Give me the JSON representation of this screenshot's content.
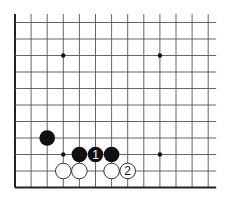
{
  "diagram": {
    "type": "go-board-corner",
    "grid": {
      "columns": 13,
      "rows": 11,
      "open_top": true,
      "open_right": true,
      "edge_left": true,
      "edge_bottom": true
    },
    "star_points": [
      {
        "col": 3,
        "row": 2
      },
      {
        "col": 9,
        "row": 2
      },
      {
        "col": 3,
        "row": 8
      },
      {
        "col": 9,
        "row": 8
      }
    ],
    "stones": [
      {
        "color": "black",
        "col": 2,
        "row": 7,
        "label": ""
      },
      {
        "color": "black",
        "col": 4,
        "row": 8,
        "label": ""
      },
      {
        "color": "black",
        "col": 5,
        "row": 8,
        "label": "1"
      },
      {
        "color": "black",
        "col": 6,
        "row": 8,
        "label": ""
      },
      {
        "color": "white",
        "col": 3,
        "row": 9,
        "label": ""
      },
      {
        "color": "white",
        "col": 4,
        "row": 9,
        "label": ""
      },
      {
        "color": "white",
        "col": 6,
        "row": 9,
        "label": ""
      },
      {
        "color": "white",
        "col": 7,
        "row": 9,
        "label": "2"
      }
    ],
    "colors": {
      "line": "#555555",
      "edge": "#222222",
      "black_stone": "#111111",
      "white_stone": "#ffffff",
      "background": "#ffffff"
    }
  }
}
